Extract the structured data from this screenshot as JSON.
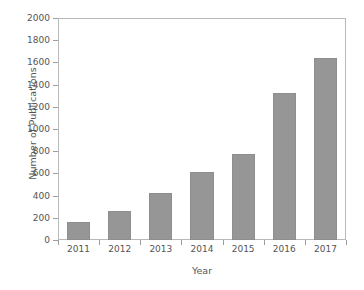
{
  "chart_data": {
    "type": "bar",
    "title": "",
    "subtitle": "",
    "xlabel": "Year",
    "ylabel": "Number of Publications",
    "categories": [
      "2011",
      "2012",
      "2013",
      "2014",
      "2015",
      "2016",
      "2017"
    ],
    "values": [
      160,
      265,
      425,
      613,
      775,
      1325,
      1640
    ],
    "series": [
      {
        "name": "Number of Publications",
        "values": [
          160,
          265,
          425,
          613,
          775,
          1325,
          1640
        ]
      }
    ],
    "ylim": [
      0,
      2000
    ],
    "ytick_labels": [
      "0",
      "200",
      "400",
      "600",
      "800",
      "1000",
      "1200",
      "1400",
      "1600",
      "1800",
      "2000"
    ],
    "ytick_values": [
      0,
      200,
      400,
      600,
      800,
      1000,
      1200,
      1400,
      1600,
      1800,
      2000
    ],
    "xtick_labels": [
      "2011",
      "2012",
      "2013",
      "2014",
      "2015",
      "2016",
      "2017"
    ],
    "grid": false,
    "legend": false,
    "legend_position": "none",
    "bar_color": "#969696",
    "axis_color": "#b9b9b9",
    "background_color": "#ffffff",
    "text_color": "#555555",
    "annotations": []
  }
}
